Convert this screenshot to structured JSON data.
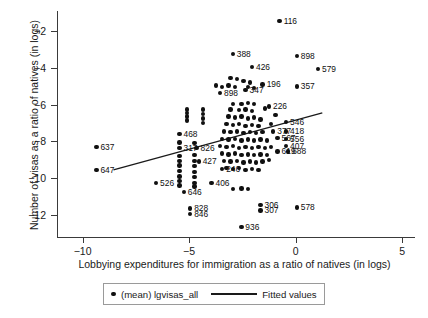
{
  "chart_data": {
    "type": "scatter",
    "title": "",
    "xlabel": "Lobbying expenditures for immigration as a ratio of natives (in logs)",
    "ylabel": "Number of visas as a ratio of natives (in logs)",
    "xlim": [
      -11.2,
      5.6
    ],
    "ylim": [
      -13.2,
      -0.9
    ],
    "xticks": [
      -10,
      -5,
      0,
      5
    ],
    "yticks": [
      -2,
      -4,
      -6,
      -8,
      -10,
      -12
    ],
    "grid": false,
    "legend_position": "bottom-center",
    "series": [
      {
        "name": "(mean) lgvisas_all",
        "marker": "circle",
        "color": "#101010",
        "points": [
          {
            "label": "116",
            "x": -0.75,
            "y": -1.45
          },
          {
            "label": "388",
            "x": -2.95,
            "y": -3.25
          },
          {
            "label": "426",
            "x": -2.05,
            "y": -3.95
          },
          {
            "label": "898",
            "x": 0.05,
            "y": -3.35
          },
          {
            "label": "579",
            "x": 1.05,
            "y": -4.05
          },
          {
            "label": "357",
            "x": 0.05,
            "y": -5.0
          },
          {
            "label": "898b",
            "x": -3.55,
            "y": -5.35
          },
          {
            "label": "196",
            "x": -1.55,
            "y": -4.9
          },
          {
            "label": "347",
            "x": -2.35,
            "y": -5.2
          },
          {
            "label": "226",
            "x": -1.25,
            "y": -6.1
          },
          {
            "label": "546",
            "x": -0.45,
            "y": -6.95
          },
          {
            "label": "377",
            "x": -1.05,
            "y": -7.45
          },
          {
            "label": "418",
            "x": -0.45,
            "y": -7.45
          },
          {
            "label": "567",
            "x": -0.85,
            "y": -7.8
          },
          {
            "label": "556",
            "x": -0.45,
            "y": -7.85
          },
          {
            "label": "407",
            "x": -0.45,
            "y": -8.25
          },
          {
            "label": "619",
            "x": -0.85,
            "y": -8.55
          },
          {
            "label": "688",
            "x": -0.35,
            "y": -8.55
          },
          {
            "label": "637",
            "x": -9.35,
            "y": -8.3
          },
          {
            "label": "647",
            "x": -9.35,
            "y": -9.55
          },
          {
            "label": "526",
            "x": -6.55,
            "y": -10.25
          },
          {
            "label": "468",
            "x": -5.45,
            "y": -7.6
          },
          {
            "label": "317",
            "x": -5.45,
            "y": -8.35
          },
          {
            "label": "826",
            "x": -4.65,
            "y": -8.35
          },
          {
            "label": "427",
            "x": -4.55,
            "y": -9.1
          },
          {
            "label": "246",
            "x": -3.45,
            "y": -9.5
          },
          {
            "label": "406",
            "x": -3.95,
            "y": -10.25
          },
          {
            "label": "646",
            "x": -5.25,
            "y": -10.75
          },
          {
            "label": "828",
            "x": -4.95,
            "y": -11.65
          },
          {
            "label": "846",
            "x": -4.95,
            "y": -11.95
          },
          {
            "label": "306",
            "x": -1.65,
            "y": -11.45
          },
          {
            "label": "307",
            "x": -1.65,
            "y": -11.75
          },
          {
            "label": "578",
            "x": 0.05,
            "y": -11.6
          },
          {
            "label": "936",
            "x": -2.55,
            "y": -12.65
          }
        ],
        "unlabeled_cluster": [
          {
            "x": -5.1,
            "y": -6.25
          },
          {
            "x": -5.1,
            "y": -6.45
          },
          {
            "x": -5.1,
            "y": -6.65
          },
          {
            "x": -5.1,
            "y": -6.85
          },
          {
            "x": -4.35,
            "y": -6.25
          },
          {
            "x": -4.35,
            "y": -6.5
          },
          {
            "x": -4.35,
            "y": -6.75
          },
          {
            "x": -4.35,
            "y": -7.0
          },
          {
            "x": -5.45,
            "y": -8.05
          },
          {
            "x": -5.45,
            "y": -8.8
          },
          {
            "x": -5.45,
            "y": -9.05
          },
          {
            "x": -5.45,
            "y": -9.3
          },
          {
            "x": -5.45,
            "y": -9.6
          },
          {
            "x": -5.45,
            "y": -9.9
          },
          {
            "x": -5.45,
            "y": -10.15
          },
          {
            "x": -5.45,
            "y": -10.4
          },
          {
            "x": -4.75,
            "y": -8.1
          },
          {
            "x": -4.75,
            "y": -8.75
          },
          {
            "x": -4.75,
            "y": -9.05
          },
          {
            "x": -4.75,
            "y": -9.35
          },
          {
            "x": -4.75,
            "y": -9.65
          },
          {
            "x": -4.75,
            "y": -9.95
          },
          {
            "x": -4.75,
            "y": -10.25
          },
          {
            "x": -4.75,
            "y": -10.45
          },
          {
            "x": -3.05,
            "y": -4.55
          },
          {
            "x": -2.75,
            "y": -4.6
          },
          {
            "x": -2.45,
            "y": -4.7
          },
          {
            "x": -2.15,
            "y": -4.8
          },
          {
            "x": -3.15,
            "y": -4.95
          },
          {
            "x": -2.85,
            "y": -5.05
          },
          {
            "x": -2.25,
            "y": -5.05
          },
          {
            "x": -1.95,
            "y": -5.1
          },
          {
            "x": -2.95,
            "y": -5.95
          },
          {
            "x": -2.55,
            "y": -5.95
          },
          {
            "x": -2.25,
            "y": -5.9
          },
          {
            "x": -1.95,
            "y": -5.95
          },
          {
            "x": -3.05,
            "y": -6.25
          },
          {
            "x": -2.65,
            "y": -6.3
          },
          {
            "x": -2.35,
            "y": -6.25
          },
          {
            "x": -2.05,
            "y": -6.35
          },
          {
            "x": -3.15,
            "y": -6.65
          },
          {
            "x": -2.85,
            "y": -6.7
          },
          {
            "x": -2.55,
            "y": -6.65
          },
          {
            "x": -2.25,
            "y": -6.75
          },
          {
            "x": -1.95,
            "y": -6.7
          },
          {
            "x": -1.65,
            "y": -6.8
          },
          {
            "x": -3.25,
            "y": -7.05
          },
          {
            "x": -2.95,
            "y": -7.1
          },
          {
            "x": -2.65,
            "y": -7.05
          },
          {
            "x": -2.35,
            "y": -7.15
          },
          {
            "x": -2.05,
            "y": -7.1
          },
          {
            "x": -1.75,
            "y": -7.15
          },
          {
            "x": -3.35,
            "y": -7.45
          },
          {
            "x": -3.05,
            "y": -7.5
          },
          {
            "x": -2.75,
            "y": -7.45
          },
          {
            "x": -2.45,
            "y": -7.55
          },
          {
            "x": -2.15,
            "y": -7.5
          },
          {
            "x": -1.85,
            "y": -7.55
          },
          {
            "x": -1.55,
            "y": -7.5
          },
          {
            "x": -3.45,
            "y": -7.85
          },
          {
            "x": -3.15,
            "y": -7.9
          },
          {
            "x": -2.85,
            "y": -7.85
          },
          {
            "x": -2.55,
            "y": -7.95
          },
          {
            "x": -2.25,
            "y": -7.9
          },
          {
            "x": -1.95,
            "y": -7.95
          },
          {
            "x": -1.65,
            "y": -7.9
          },
          {
            "x": -1.35,
            "y": -7.95
          },
          {
            "x": -3.55,
            "y": -8.25
          },
          {
            "x": -3.25,
            "y": -8.3
          },
          {
            "x": -2.95,
            "y": -8.25
          },
          {
            "x": -2.65,
            "y": -8.35
          },
          {
            "x": -2.35,
            "y": -8.3
          },
          {
            "x": -2.05,
            "y": -8.35
          },
          {
            "x": -1.75,
            "y": -8.3
          },
          {
            "x": -1.45,
            "y": -8.35
          },
          {
            "x": -1.15,
            "y": -8.3
          },
          {
            "x": -3.45,
            "y": -8.65
          },
          {
            "x": -3.15,
            "y": -8.7
          },
          {
            "x": -2.85,
            "y": -8.65
          },
          {
            "x": -2.55,
            "y": -8.75
          },
          {
            "x": -2.25,
            "y": -8.7
          },
          {
            "x": -1.95,
            "y": -8.75
          },
          {
            "x": -1.65,
            "y": -8.7
          },
          {
            "x": -1.35,
            "y": -8.75
          },
          {
            "x": -3.35,
            "y": -9.05
          },
          {
            "x": -3.05,
            "y": -9.1
          },
          {
            "x": -2.75,
            "y": -9.05
          },
          {
            "x": -2.45,
            "y": -9.15
          },
          {
            "x": -2.15,
            "y": -9.1
          },
          {
            "x": -1.85,
            "y": -9.15
          },
          {
            "x": -1.55,
            "y": -9.1
          },
          {
            "x": -3.25,
            "y": -9.45
          },
          {
            "x": -2.95,
            "y": -9.5
          },
          {
            "x": -2.65,
            "y": -9.45
          },
          {
            "x": -2.35,
            "y": -9.55
          },
          {
            "x": -2.05,
            "y": -9.5
          },
          {
            "x": -1.75,
            "y": -9.55
          },
          {
            "x": -2.95,
            "y": -10.6
          },
          {
            "x": -2.55,
            "y": -10.55
          },
          {
            "x": -2.25,
            "y": -10.6
          },
          {
            "x": -3.75,
            "y": -4.95
          },
          {
            "x": -3.45,
            "y": -5.05
          },
          {
            "x": -1.45,
            "y": -6.2
          },
          {
            "x": -1.15,
            "y": -7.05
          },
          {
            "x": -0.95,
            "y": -6.55
          },
          {
            "x": -1.25,
            "y": -9.0
          }
        ]
      },
      {
        "name": "Fitted values",
        "type": "line",
        "color": "#1a1a1a",
        "endpoints": [
          {
            "x": -8.55,
            "y": -9.55
          },
          {
            "x": 1.25,
            "y": -6.45
          }
        ]
      }
    ]
  },
  "legend": {
    "scatter_label": "(mean) lgvisas_all",
    "line_label": "Fitted values"
  }
}
